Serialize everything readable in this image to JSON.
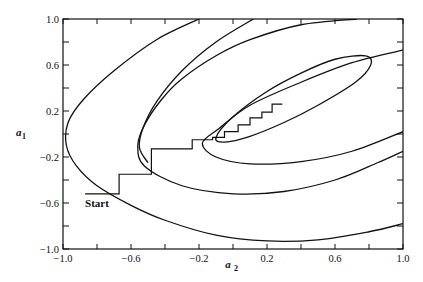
{
  "chart_data": {
    "type": "line",
    "title": "",
    "xlabel": "a2",
    "ylabel": "a1",
    "xlim": [
      -1.0,
      1.0
    ],
    "ylim": [
      -1.0,
      1.0
    ],
    "grid": false,
    "legend": null,
    "x_ticks": [
      "-1.0",
      "-0.6",
      "-0.2",
      "0.2",
      "0.6",
      "1.0"
    ],
    "x_tick_values": [
      -1.0,
      -0.6,
      -0.2,
      0.2,
      0.6,
      1.0
    ],
    "x_minor_ticks": [
      -0.8,
      -0.4,
      0.0,
      0.4,
      0.8
    ],
    "y_ticks": [
      "1.0",
      "0.6",
      "0.2",
      "-0.2",
      "-0.6",
      "-1.0"
    ],
    "y_tick_values": [
      1.0,
      0.6,
      0.2,
      -0.2,
      -0.6,
      -1.0
    ],
    "y_minor_ticks": [
      0.8,
      0.4,
      0.0,
      -0.4,
      -0.8
    ],
    "annotations": [
      {
        "text": "Start",
        "x": -0.87,
        "y": -0.6
      }
    ],
    "series": [
      {
        "name": "contour-1-outer",
        "kind": "open-contour",
        "points": [
          [
            0.73,
            1.0
          ],
          [
            0.4,
            0.95
          ],
          [
            0.1,
            0.82
          ],
          [
            -0.1,
            0.68
          ],
          [
            -0.3,
            0.48
          ],
          [
            -0.42,
            0.3
          ],
          [
            -0.52,
            0.08
          ],
          [
            -0.56,
            -0.1
          ],
          [
            -0.52,
            -0.28
          ],
          [
            -0.3,
            -0.45
          ],
          [
            0.0,
            -0.52
          ],
          [
            0.3,
            -0.5
          ],
          [
            0.6,
            -0.4
          ],
          [
            0.85,
            -0.25
          ],
          [
            1.0,
            -0.15
          ]
        ]
      },
      {
        "name": "contour-2",
        "kind": "open-contour",
        "points": [
          [
            0.12,
            1.0
          ],
          [
            -0.1,
            0.8
          ],
          [
            -0.3,
            0.55
          ],
          [
            -0.45,
            0.28
          ],
          [
            -0.53,
            0.05
          ],
          [
            -0.55,
            -0.12
          ],
          [
            -0.5,
            -0.25
          ]
        ]
      },
      {
        "name": "contour-3-outermost",
        "kind": "open-contour",
        "points": [
          [
            -0.2,
            1.0
          ],
          [
            -0.45,
            0.82
          ],
          [
            -0.7,
            0.55
          ],
          [
            -0.88,
            0.3
          ],
          [
            -0.97,
            0.1
          ],
          [
            -0.98,
            -0.1
          ],
          [
            -0.92,
            -0.28
          ],
          [
            -0.8,
            -0.45
          ],
          [
            -0.6,
            -0.62
          ],
          [
            -0.4,
            -0.75
          ],
          [
            -0.1,
            -0.88
          ],
          [
            0.2,
            -0.93
          ],
          [
            0.5,
            -0.92
          ],
          [
            0.8,
            -0.85
          ],
          [
            1.0,
            -0.78
          ]
        ]
      },
      {
        "name": "contour-4",
        "kind": "open-contour",
        "points": [
          [
            1.0,
            0.73
          ],
          [
            0.7,
            0.62
          ],
          [
            0.4,
            0.45
          ],
          [
            0.1,
            0.25
          ],
          [
            -0.08,
            0.05
          ],
          [
            -0.18,
            -0.08
          ],
          [
            -0.1,
            -0.2
          ],
          [
            0.1,
            -0.26
          ],
          [
            0.4,
            -0.24
          ],
          [
            0.7,
            -0.15
          ],
          [
            1.0,
            0.02
          ]
        ]
      },
      {
        "name": "contour-5-inner-ellipse",
        "kind": "closed-contour",
        "points": [
          [
            -0.1,
            -0.03
          ],
          [
            0.0,
            0.15
          ],
          [
            0.2,
            0.37
          ],
          [
            0.4,
            0.53
          ],
          [
            0.6,
            0.65
          ],
          [
            0.78,
            0.68
          ],
          [
            0.81,
            0.6
          ],
          [
            0.72,
            0.45
          ],
          [
            0.5,
            0.25
          ],
          [
            0.3,
            0.1
          ],
          [
            0.1,
            -0.02
          ],
          [
            -0.05,
            -0.07
          ],
          [
            -0.1,
            -0.03
          ]
        ]
      },
      {
        "name": "search-path",
        "kind": "staircase",
        "points": [
          [
            -0.87,
            -0.52
          ],
          [
            -0.67,
            -0.52
          ],
          [
            -0.67,
            -0.35
          ],
          [
            -0.48,
            -0.35
          ],
          [
            -0.48,
            -0.13
          ],
          [
            -0.24,
            -0.13
          ],
          [
            -0.24,
            -0.05
          ],
          [
            -0.12,
            -0.05
          ],
          [
            -0.12,
            -0.03
          ],
          [
            -0.05,
            -0.03
          ],
          [
            -0.05,
            0.02
          ],
          [
            0.03,
            0.02
          ],
          [
            0.03,
            0.08
          ],
          [
            0.1,
            0.08
          ],
          [
            0.1,
            0.14
          ],
          [
            0.17,
            0.14
          ],
          [
            0.17,
            0.19
          ],
          [
            0.23,
            0.19
          ],
          [
            0.23,
            0.26
          ],
          [
            0.29,
            0.26
          ]
        ]
      }
    ]
  }
}
